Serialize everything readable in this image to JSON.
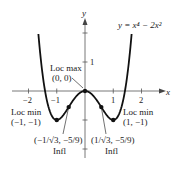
{
  "chart_data": {
    "type": "line",
    "title": "",
    "equation_label": "y = x⁴ − 2x²",
    "xlabel": "x",
    "ylabel": "y",
    "x_ticks": [
      "−2",
      "−1",
      "1",
      "2"
    ],
    "y_ticks": [
      "1"
    ],
    "xlim": [
      -2.6,
      2.6
    ],
    "ylim": [
      -1.6,
      2.5
    ],
    "grid": false,
    "series": [
      {
        "name": "y = x^4 - 2x^2",
        "function": "x^4 - 2x^2",
        "x_range": [
          -1.65,
          1.65
        ]
      }
    ],
    "points": [
      {
        "name": "Loc max",
        "x": 0,
        "y": 0,
        "label": "Loc max",
        "coords": "(0, 0)"
      },
      {
        "name": "Loc min",
        "x": -1,
        "y": -1,
        "label": "Loc min",
        "coords": "(−1, −1)"
      },
      {
        "name": "Loc min",
        "x": 1,
        "y": -1,
        "label": "Loc min",
        "coords": "(1, −1)"
      },
      {
        "name": "Infl",
        "x": -0.577,
        "y": -0.556,
        "label": "Infl",
        "coords": "(−1/√3, −5/9)"
      },
      {
        "name": "Infl",
        "x": 0.577,
        "y": -0.556,
        "label": "Infl",
        "coords": "(1/√3, −5/9)"
      }
    ]
  },
  "labels": {
    "equation": "y = x⁴ − 2x²",
    "x_axis": "x",
    "y_axis": "y",
    "tick_x_neg2": "−2",
    "tick_x_neg1": "−1",
    "tick_x_1": "1",
    "tick_x_2": "2",
    "tick_y_1": "1",
    "loc_max": "Loc max",
    "loc_max_coords": "(0, 0)",
    "loc_min_left": "Loc min",
    "loc_min_left_coords": "(−1, −1)",
    "loc_min_right": "Loc min",
    "loc_min_right_coords": "(1, −1)",
    "infl_left_coords": "(−1/√3, −5/9)",
    "infl_left": "Infl",
    "infl_right_coords": "(1/√3, −5/9)",
    "infl_right": "Infl"
  }
}
